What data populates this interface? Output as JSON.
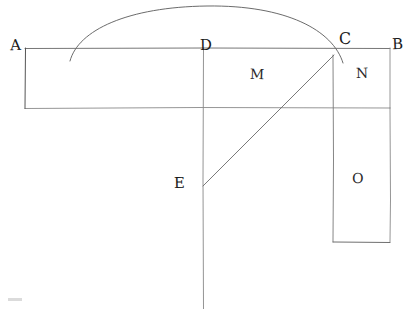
{
  "diagram": {
    "canvas": {
      "width": 416,
      "height": 309
    },
    "background_color": "#ffffff",
    "ink_color": "#555555",
    "label_color": "#1a1a1a",
    "labels": {
      "A": "A",
      "B": "B",
      "C": "C",
      "D": "D",
      "E": "E",
      "M": "M",
      "N": "N",
      "O": "O"
    },
    "points": [
      {
        "name": "A",
        "x": 25,
        "y": 48,
        "label": "A"
      },
      {
        "name": "D",
        "x": 203,
        "y": 48,
        "label": "D"
      },
      {
        "name": "C",
        "x": 333,
        "y": 55,
        "label": "C"
      },
      {
        "name": "B",
        "x": 390,
        "y": 48,
        "label": "B"
      },
      {
        "name": "E",
        "x": 203,
        "y": 185,
        "label": "E"
      }
    ],
    "regions": [
      {
        "name": "M",
        "label": "M",
        "x": 258,
        "y": 78,
        "description": "upper band region left of C"
      },
      {
        "name": "N",
        "label": "N",
        "x": 363,
        "y": 75,
        "description": "upper band region right of C"
      },
      {
        "name": "O",
        "label": "O",
        "x": 357,
        "y": 180,
        "description": "lower right rectangle"
      }
    ],
    "segments": [
      {
        "name": "line-AB-top",
        "x1": 25,
        "y1": 48,
        "x2": 390,
        "y2": 48
      },
      {
        "name": "band-bottom",
        "x1": 25,
        "y1": 108,
        "x2": 390,
        "y2": 108
      },
      {
        "name": "band-left-edge",
        "x1": 25,
        "y1": 48,
        "x2": 25,
        "y2": 108
      },
      {
        "name": "band-right-edge",
        "x1": 390,
        "y1": 48,
        "x2": 390,
        "y2": 108
      },
      {
        "name": "vertical-D-axis",
        "x1": 203,
        "y1": 48,
        "x2": 203,
        "y2": 309
      },
      {
        "name": "vertical-C-drop",
        "x1": 333,
        "y1": 55,
        "x2": 333,
        "y2": 242
      },
      {
        "name": "rect-O-right",
        "x1": 390,
        "y1": 108,
        "x2": 390,
        "y2": 242
      },
      {
        "name": "rect-O-bottom",
        "x1": 333,
        "y1": 242,
        "x2": 390,
        "y2": 242
      },
      {
        "name": "diagonal-EC",
        "x1": 203,
        "y1": 185,
        "x2": 333,
        "y2": 55
      }
    ],
    "arc": {
      "name": "semicircular-arc",
      "start": {
        "x": 70,
        "y": 61
      },
      "apex": {
        "x": 207,
        "y": 6
      },
      "end": {
        "x": 343,
        "y": 63
      },
      "description": "arc passing through point C"
    }
  }
}
